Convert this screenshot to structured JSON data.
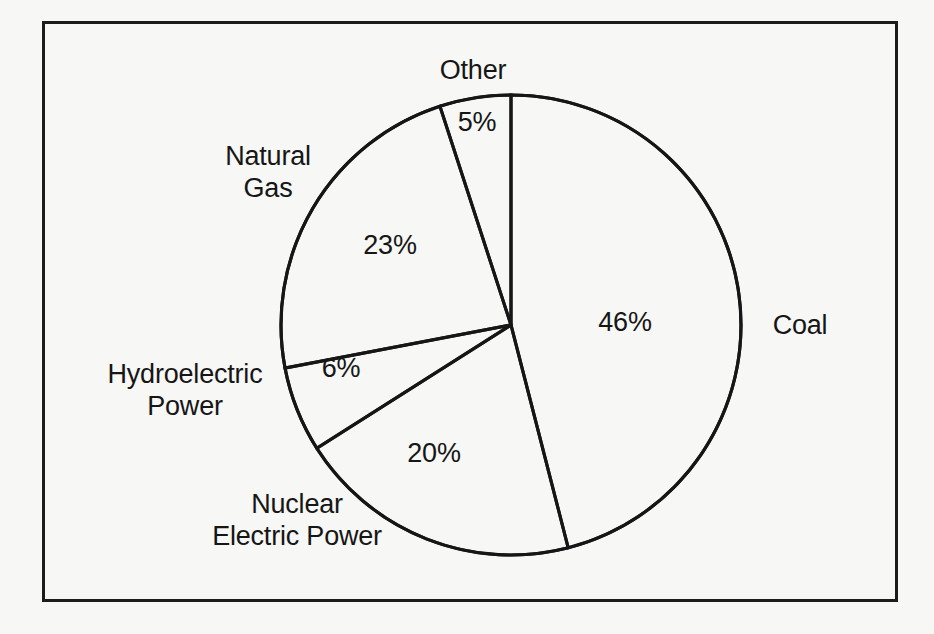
{
  "figure": {
    "background_color": "#f7f7f5",
    "frame_color": "#1c1c1c",
    "line_color": "#161616"
  },
  "chart_data": {
    "type": "pie",
    "title": "",
    "categories": [
      "Coal",
      "Nuclear Electric Power",
      "Hydroelectric Power",
      "Natural Gas",
      "Other"
    ],
    "values": [
      46,
      20,
      6,
      23,
      5
    ],
    "value_labels": [
      "46%",
      "20%",
      "6%",
      "23%",
      "5%"
    ],
    "unit": "%",
    "start_angle_deg": 0,
    "direction": "clockwise",
    "legend": "none",
    "grid": false,
    "labels_placement": "outside-category-inside-value"
  },
  "slices": [
    {
      "name": "coal",
      "category": "Coal",
      "value": 46,
      "value_label": "46%",
      "category_label": "Coal",
      "value_label_x": 625,
      "value_label_y": 322,
      "category_label_x": 800,
      "category_label_y": 325
    },
    {
      "name": "nuclear-electric-power",
      "category": "Nuclear Electric Power",
      "value": 20,
      "value_label": "20%",
      "category_label": "Nuclear\nElectric Power",
      "value_label_x": 434,
      "value_label_y": 453,
      "category_label_x": 297,
      "category_label_y": 520
    },
    {
      "name": "hydroelectric-power",
      "category": "Hydroelectric Power",
      "value": 6,
      "value_label": "6%",
      "category_label": "Hydroelectric\nPower",
      "value_label_x": 341,
      "value_label_y": 368,
      "category_label_x": 185,
      "category_label_y": 390
    },
    {
      "name": "natural-gas",
      "category": "Natural Gas",
      "value": 23,
      "value_label": "23%",
      "category_label": "Natural\nGas",
      "value_label_x": 390,
      "value_label_y": 245,
      "category_label_x": 268,
      "category_label_y": 172
    },
    {
      "name": "other",
      "category": "Other",
      "value": 5,
      "value_label": "5%",
      "category_label": "Other",
      "value_label_x": 477,
      "value_label_y": 122,
      "category_label_x": 473,
      "category_label_y": 70
    }
  ],
  "geometry": {
    "center_x": 511,
    "center_y": 325,
    "radius": 230
  }
}
